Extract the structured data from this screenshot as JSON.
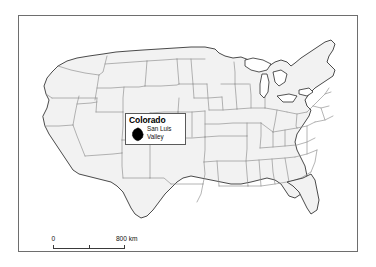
{
  "figure": {
    "type": "locator-map",
    "region": "Continental United States",
    "background_color": "#ffffff",
    "frame_color": "#6e6e6e",
    "land_fill_color": "#f2f2f2",
    "state_border_color": "#8d8d8d",
    "coast_border_color": "#2b2b2b",
    "marker_color": "#000000"
  },
  "callout": {
    "title": "Colorado",
    "feature_line1": "San Luis",
    "feature_line2": "Valley",
    "marker_name": "san-luis-valley-marker"
  },
  "scale": {
    "min_label": "0",
    "max_label": "800 km",
    "units": "km",
    "max_value": 800,
    "midpoint_value": 400
  }
}
